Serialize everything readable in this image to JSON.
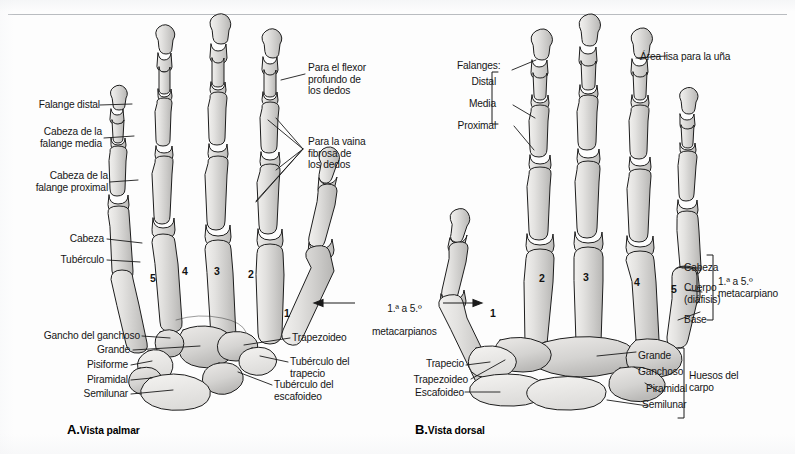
{
  "figure": {
    "type": "anatomical-illustration",
    "language": "es",
    "panels": [
      {
        "key": "A",
        "letter": "A.",
        "title": "Vista palmar"
      },
      {
        "key": "B",
        "letter": "B.",
        "title": "Vista dorsal"
      }
    ]
  },
  "colors": {
    "background": "#fdfdfd",
    "rule": "#b9bcc0",
    "bone_fill_light": "#e9e8e6",
    "bone_fill_mid": "#d3d2d0",
    "bone_fill_dark": "#bcbbb9",
    "bone_outline": "#1d1d1d",
    "leader_line": "#1a1a1a",
    "text": "#161616"
  },
  "panel_a": {
    "title_letter": "A.",
    "title_text": "Vista palmar",
    "labels_left": [
      {
        "id": "falange-distal",
        "text": "Falange distal"
      },
      {
        "id": "cabeza-falange-media",
        "text": "Cabeza de la\nfalange media"
      },
      {
        "id": "cabeza-falange-proximal",
        "text": "Cabeza de la\nfalange proximal"
      },
      {
        "id": "cabeza",
        "text": "Cabeza"
      },
      {
        "id": "tuberculo",
        "text": "Tubérculo"
      },
      {
        "id": "gancho-del-ganchoso",
        "text": "Gancho del ganchoso"
      },
      {
        "id": "grande",
        "text": "Grande"
      },
      {
        "id": "pisiforme",
        "text": "Pisiforme"
      },
      {
        "id": "piramidal",
        "text": "Piramidal"
      },
      {
        "id": "semilunar",
        "text": "Semilunar"
      }
    ],
    "labels_right": [
      {
        "id": "para-flexor-profundo",
        "text": "Para el flexor\nprofundo de\nlos dedos"
      },
      {
        "id": "para-vaina-fibrosa",
        "text": "Para la vaina\nfibrosa de\nlos dedos"
      },
      {
        "id": "trapezoideo",
        "text": "Trapezoideo"
      },
      {
        "id": "tuberculo-del-trapecio",
        "text": "Tubérculo del\ntrapecio"
      },
      {
        "id": "tuberculo-del-escafoideo",
        "text": "Tubérculo del\nescafoideo"
      }
    ],
    "bone_numbers": [
      {
        "id": "metacarpal-5",
        "text": "5"
      },
      {
        "id": "metacarpal-4",
        "text": "4"
      },
      {
        "id": "metacarpal-3",
        "text": "3"
      },
      {
        "id": "metacarpal-2",
        "text": "2"
      },
      {
        "id": "metacarpal-1",
        "text": "1"
      }
    ]
  },
  "panel_b": {
    "title_letter": "B.",
    "title_text": "Vista dorsal",
    "phalanges_bracket": {
      "id": "falanges-bracket",
      "heading": "Falanges:",
      "items": [
        {
          "id": "falange-distal",
          "text": "Distal"
        },
        {
          "id": "falange-media",
          "text": "Media"
        },
        {
          "id": "falange-proximal",
          "text": "Proximal"
        }
      ]
    },
    "nail_label": {
      "id": "area-lisa-una",
      "text": "Área lisa para la uña"
    },
    "metacarpal_bracket": {
      "id": "metacarpiano-bracket",
      "caption": "1.ª a 5.º\nmetacarpiano",
      "items": [
        {
          "id": "cabeza",
          "text": "Cabeza"
        },
        {
          "id": "cuerpo-diafisis",
          "text": "Cuerpo\n(diáfisis)"
        },
        {
          "id": "base",
          "text": "Base"
        }
      ]
    },
    "carpal_bracket": {
      "id": "huesos-carpo-bracket",
      "caption": "Huesos del\ncarpo",
      "items_right": [
        {
          "id": "grande",
          "text": "Grande"
        },
        {
          "id": "ganchoso",
          "text": "Ganchoso"
        },
        {
          "id": "piramidal",
          "text": "Piramidal"
        },
        {
          "id": "semilunar",
          "text": "Semilunar"
        }
      ]
    },
    "labels_left": [
      {
        "id": "trapecio",
        "text": "Trapecio"
      },
      {
        "id": "trapezoideo",
        "text": "Trapezoideo"
      },
      {
        "id": "escafoideo",
        "text": "Escafoideo"
      }
    ],
    "bone_numbers": [
      {
        "id": "metacarpal-1",
        "text": "1"
      },
      {
        "id": "metacarpal-2",
        "text": "2"
      },
      {
        "id": "metacarpal-3",
        "text": "3"
      },
      {
        "id": "metacarpal-4",
        "text": "4"
      },
      {
        "id": "metacarpal-5",
        "text": "5"
      }
    ]
  },
  "center_annotation": {
    "id": "metacarpianos-span",
    "line1_prefix": "1.",
    "line1_sup_a": "ª",
    "line1_mid": " a 5.",
    "line1_sup_b": "º",
    "line1": "1.ª a 5.º",
    "line2": "metacarpianos"
  }
}
